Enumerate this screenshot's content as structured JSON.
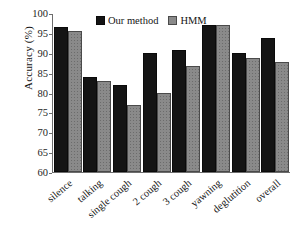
{
  "chart_data": {
    "type": "bar",
    "title": "",
    "xlabel": "",
    "ylabel": "Accuracy (%)",
    "ylim": [
      60,
      100
    ],
    "yticks": [
      100,
      95,
      90,
      85,
      80,
      75,
      70,
      65,
      60
    ],
    "ytick_labels": [
      "100",
      "95",
      "90",
      "85",
      "80",
      "75",
      "70",
      "65",
      "60"
    ],
    "grid": false,
    "legend_position": "top-center",
    "categories": [
      "silence",
      "talking",
      "single cough",
      "2 cough",
      "3 cough",
      "yawning",
      "deglutition",
      "overall"
    ],
    "series": [
      {
        "name": "Our method",
        "color": "#141414",
        "values": [
          96.2,
          83.5,
          81.5,
          89.5,
          90.5,
          96.7,
          89.5,
          93.5
        ]
      },
      {
        "name": "HMM",
        "color": "#8a8a8a",
        "values": [
          95.3,
          82.6,
          76.4,
          79.6,
          86.4,
          96.6,
          88.4,
          87.4
        ]
      }
    ]
  },
  "legend": {
    "entries": [
      {
        "label": "Our method",
        "swatch": "legend-swatch-black"
      },
      {
        "label": "HMM",
        "swatch": "legend-swatch-gray"
      }
    ]
  }
}
